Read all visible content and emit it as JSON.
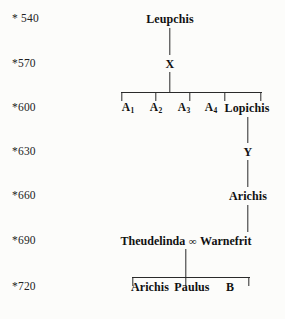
{
  "diagram": {
    "type": "family-tree",
    "text_color": "#181818",
    "line_color": "#2a2a2a",
    "background_color": "#fcfcfa"
  },
  "years": [
    {
      "label": "* 540",
      "y": 19
    },
    {
      "label": "*570",
      "y": 64
    },
    {
      "label": "*600",
      "y": 108
    },
    {
      "label": "*630",
      "y": 152
    },
    {
      "label": "*660",
      "y": 196
    },
    {
      "label": "*690",
      "y": 241
    },
    {
      "label": "*720",
      "y": 287
    }
  ],
  "nodes": {
    "leupchis": {
      "label": "Leupchis",
      "x": 170,
      "y": 19
    },
    "x": {
      "label": "X",
      "x": 170,
      "y": 64
    },
    "a1": {
      "label": "A",
      "sub": "1",
      "x": 128,
      "y": 108
    },
    "a2": {
      "label": "A",
      "sub": "2",
      "x": 156,
      "y": 108
    },
    "a3": {
      "label": "A",
      "sub": "3",
      "x": 184,
      "y": 108
    },
    "a4": {
      "label": "A",
      "sub": "4",
      "x": 211,
      "y": 108
    },
    "lopichis": {
      "label": "Lopichis",
      "x": 247,
      "y": 108
    },
    "y": {
      "label": "Y",
      "x": 248,
      "y": 152
    },
    "arichis_660": {
      "label": "Arichis",
      "x": 248,
      "y": 196
    },
    "theudelinda": {
      "label": "Theudelinda",
      "marriage_symbol": "∞",
      "spouse": "Warnefrit",
      "x": 186,
      "y": 241
    },
    "arichis_720": {
      "label": "Arichis",
      "x": 150,
      "y": 287
    },
    "paulus": {
      "label": "Paulus",
      "x": 192,
      "y": 287
    },
    "b": {
      "label": "B",
      "x": 230,
      "y": 287
    }
  },
  "connectors": {
    "leupchis_to_x": {
      "x": 170,
      "top": 28,
      "height": 27
    },
    "x_to_sibling_bar": {
      "x": 170,
      "top": 72,
      "height": 20
    },
    "sibling_bar": {
      "left": 121,
      "top": 92,
      "width": 141
    },
    "sibling_drops": [
      {
        "x": 122,
        "top": 92,
        "height": 9
      },
      {
        "x": 156,
        "top": 92,
        "height": 9
      },
      {
        "x": 190,
        "top": 92,
        "height": 9
      },
      {
        "x": 225,
        "top": 92,
        "height": 9
      },
      {
        "x": 261,
        "top": 92,
        "height": 9
      }
    ],
    "lopichis_to_y": {
      "x": 248,
      "top": 117,
      "height": 26
    },
    "y_to_arichis": {
      "x": 248,
      "top": 160,
      "height": 27
    },
    "arichis_to_warnefrit": {
      "x": 248,
      "top": 205,
      "height": 27
    },
    "marriage_to_children_bar": {
      "x": 186,
      "top": 249,
      "height": 28
    },
    "children_bar": {
      "left": 132,
      "top": 277,
      "width": 118
    },
    "children_drops": [
      {
        "x": 133,
        "top": 277,
        "height": 9
      },
      {
        "x": 186,
        "top": 277,
        "height": 9
      },
      {
        "x": 249,
        "top": 277,
        "height": 9
      }
    ]
  }
}
